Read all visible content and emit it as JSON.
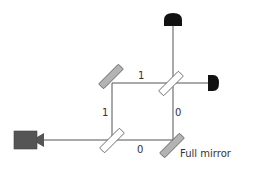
{
  "diagram": {
    "path_labels": {
      "top": "1",
      "left": "1",
      "right": "0",
      "bottom": "0"
    },
    "mirror_label": "Full mirror",
    "components": [
      {
        "name": "full-mirror-top-left",
        "type": "full mirror"
      },
      {
        "name": "beam-splitter-top-right",
        "type": "beam splitter"
      },
      {
        "name": "beam-splitter-bottom-left",
        "type": "beam splitter"
      },
      {
        "name": "full-mirror-bottom-right",
        "type": "full mirror"
      },
      {
        "name": "detector-top",
        "type": "detector"
      },
      {
        "name": "detector-right",
        "type": "detector"
      },
      {
        "name": "source",
        "type": "camera/emitter"
      }
    ],
    "colors": {
      "beam": "#555555",
      "mirror_fill": "#b3b3b3",
      "mirror_stroke": "#555555",
      "splitter_fill": "#ffffff",
      "detector": "#111111",
      "source": "#555555"
    }
  }
}
